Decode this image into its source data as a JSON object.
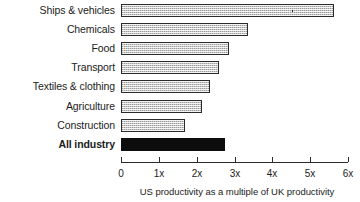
{
  "chart_data": {
    "type": "bar",
    "orientation": "horizontal",
    "title": "",
    "xlabel": "US productivity as a multiple of UK productivity",
    "ylabel": "",
    "xlim": [
      0,
      6
    ],
    "grid": false,
    "legend": "none",
    "tick_labels": [
      "0",
      "1x",
      "2x",
      "3x",
      "4x",
      "5x",
      "6x"
    ],
    "tick_values": [
      0,
      1,
      2,
      3,
      4,
      5,
      6
    ],
    "categories": [
      "Ships & vehicles",
      "Chemicals",
      "Food",
      "Transport",
      "Textiles & clothing",
      "Agriculture",
      "Construction",
      "All industry"
    ],
    "values": [
      5.63,
      3.35,
      2.85,
      2.6,
      2.35,
      2.15,
      1.7,
      2.75
    ],
    "bars": [
      {
        "label": "Ships & vehicles",
        "value": 5.63,
        "style": "hatched",
        "emphasis": false
      },
      {
        "label": "Chemicals",
        "value": 3.35,
        "style": "hatched",
        "emphasis": false
      },
      {
        "label": "Food",
        "value": 2.85,
        "style": "hatched",
        "emphasis": false
      },
      {
        "label": "Transport",
        "value": 2.6,
        "style": "hatched",
        "emphasis": false
      },
      {
        "label": "Textiles & clothing",
        "value": 2.35,
        "style": "hatched",
        "emphasis": false
      },
      {
        "label": "Agriculture",
        "value": 2.15,
        "style": "hatched",
        "emphasis": false
      },
      {
        "label": "Construction",
        "value": 1.7,
        "style": "hatched",
        "emphasis": false
      },
      {
        "label": "All industry",
        "value": 2.75,
        "style": "solid",
        "emphasis": true
      }
    ],
    "colors": {
      "bar_fill": "#c9c9c9",
      "bar_border": "#2b2b2b",
      "bar_emphasis_fill": "#0d0d0d",
      "axis": "#2b2b2b",
      "text": "#1c1c1c",
      "background": "#ffffff"
    }
  }
}
